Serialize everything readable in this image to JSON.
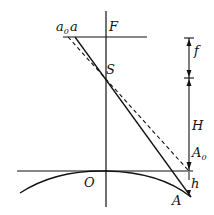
{
  "diagram": {
    "labels": {
      "a0": "a",
      "a0_sub": "0",
      "a": "a",
      "F": "F",
      "S": "S",
      "f": "f",
      "H": "H",
      "A0": "A",
      "A0_sub": "0",
      "O": "O",
      "h": "h",
      "A": "A"
    },
    "colors": {
      "stroke": "#111111",
      "background": "#ffffff"
    }
  }
}
